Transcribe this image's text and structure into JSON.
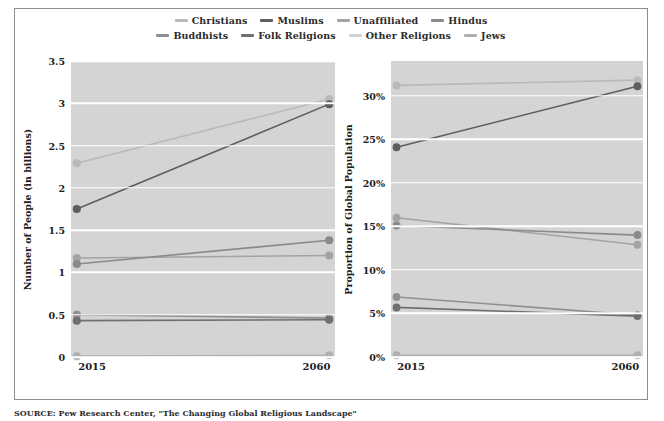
{
  "legend": {
    "rows": [
      [
        {
          "label": "Christians",
          "color": "#b9b9b9"
        },
        {
          "label": "Muslims",
          "color": "#5e5e5e"
        },
        {
          "label": "Unaffiliated",
          "color": "#a3a3a3"
        },
        {
          "label": "Hindus",
          "color": "#8a8a8a"
        }
      ],
      [
        {
          "label": "Buddhists",
          "color": "#8f8f8f"
        },
        {
          "label": "Folk Religions",
          "color": "#6f6f6f"
        },
        {
          "label": "Other Religions",
          "color": "#d3d3d3"
        },
        {
          "label": "Jews",
          "color": "#b0b0b0"
        }
      ]
    ]
  },
  "source": {
    "text": "SOURCE: Pew Research Center, \"The Changing Global Religious Landscape\""
  },
  "chart_data": [
    {
      "type": "line",
      "id": "number-of-people",
      "title": "",
      "xlabel": "",
      "ylabel": "Number of People (in billions)",
      "x": [
        "2015",
        "2060"
      ],
      "xticklabels": [
        "2015",
        "2060"
      ],
      "yticklabels": [
        "0",
        "0.5",
        "1",
        "1.5",
        "2",
        "2.5",
        "3",
        "3.5"
      ],
      "yticks": [
        0,
        0.5,
        1,
        1.5,
        2,
        2.5,
        3,
        3.5
      ],
      "ylim": [
        0,
        3.5
      ],
      "grid": true,
      "legend_position": "top",
      "series": [
        {
          "name": "Christians",
          "color": "#b9b9b9",
          "values": [
            2.29,
            3.05
          ]
        },
        {
          "name": "Muslims",
          "color": "#5e5e5e",
          "values": [
            1.75,
            2.99
          ]
        },
        {
          "name": "Unaffiliated",
          "color": "#a3a3a3",
          "values": [
            1.17,
            1.2
          ]
        },
        {
          "name": "Hindus",
          "color": "#8a8a8a",
          "values": [
            1.1,
            1.38
          ]
        },
        {
          "name": "Buddhists",
          "color": "#8f8f8f",
          "values": [
            0.5,
            0.46
          ]
        },
        {
          "name": "Folk Religions",
          "color": "#6f6f6f",
          "values": [
            0.43,
            0.44
          ]
        },
        {
          "name": "Other Religions",
          "color": "#d3d3d3",
          "values": [
            0.06,
            0.06
          ]
        },
        {
          "name": "Jews",
          "color": "#b0b0b0",
          "values": [
            0.01,
            0.02
          ]
        }
      ]
    },
    {
      "type": "line",
      "id": "proportion-of-global-population",
      "title": "",
      "xlabel": "",
      "ylabel": "Proportion of Global Population",
      "x": [
        "2015",
        "2060"
      ],
      "xticklabels": [
        "2015",
        "2060"
      ],
      "yticklabels": [
        "0%",
        "5%",
        "10%",
        "15%",
        "20%",
        "25%",
        "30%"
      ],
      "yticks": [
        0,
        5,
        10,
        15,
        20,
        25,
        30
      ],
      "ylim": [
        0,
        34
      ],
      "grid": true,
      "legend_position": "top",
      "series": [
        {
          "name": "Christians",
          "color": "#b9b9b9",
          "values": [
            31.2,
            31.8
          ]
        },
        {
          "name": "Muslims",
          "color": "#5e5e5e",
          "values": [
            24.1,
            31.1
          ]
        },
        {
          "name": "Unaffiliated",
          "color": "#a3a3a3",
          "values": [
            16.0,
            12.9
          ]
        },
        {
          "name": "Hindus",
          "color": "#8a8a8a",
          "values": [
            15.1,
            14.0
          ]
        },
        {
          "name": "Buddhists",
          "color": "#8f8f8f",
          "values": [
            6.9,
            4.8
          ]
        },
        {
          "name": "Folk Religions",
          "color": "#6f6f6f",
          "values": [
            5.7,
            4.7
          ]
        },
        {
          "name": "Other Religions",
          "color": "#d3d3d3",
          "values": [
            0.8,
            0.7
          ]
        },
        {
          "name": "Jews",
          "color": "#b0b0b0",
          "values": [
            0.2,
            0.2
          ]
        }
      ]
    }
  ]
}
